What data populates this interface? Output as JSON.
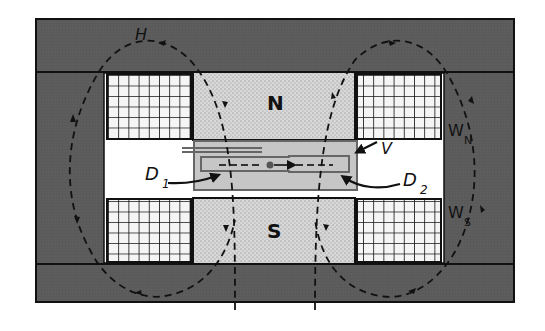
{
  "diagram": {
    "type": "cyclotron magnet cross-section",
    "labels": {
      "field": "H",
      "north_pole": "N",
      "south_pole": "S",
      "vacuum_chamber": "V",
      "dee_1_main": "D",
      "dee_1_sub": "1",
      "dee_2_main": "D",
      "dee_2_sub": "2",
      "winding_north_main": "W",
      "winding_north_sub": "N",
      "winding_south_main": "W",
      "winding_south_sub": "S"
    },
    "colors": {
      "yoke": "#5a5a5a",
      "pole": "#d4d4d4",
      "chamber": "#c4c4c4",
      "coil_bg": "#f4f4f4",
      "line": "#111111",
      "gap": "#ffffff"
    }
  }
}
